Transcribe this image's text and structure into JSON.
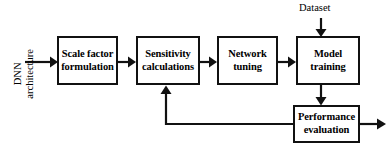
{
  "diagram": {
    "type": "flowchart",
    "colors": {
      "stroke": "#111111",
      "background": "#ffffff",
      "text": "#000000"
    },
    "inputs": [
      {
        "id": "dnn-architecture",
        "label": "DNN\narchitecture",
        "orientation": "vertical"
      },
      {
        "id": "dataset",
        "label": "Dataset",
        "orientation": "horizontal"
      }
    ],
    "nodes": [
      {
        "id": "scale-factor-formulation",
        "label": "Scale factor\nformulation"
      },
      {
        "id": "sensitivity-calculations",
        "label": "Sensitivity\ncalculations"
      },
      {
        "id": "network-tuning",
        "label": "Network\ntuning"
      },
      {
        "id": "model-training",
        "label": "Model\ntraining"
      },
      {
        "id": "performance-evaluation",
        "label": "Performance\nevaluation"
      }
    ],
    "edges": [
      {
        "from": "dnn-architecture",
        "to": "scale-factor-formulation"
      },
      {
        "from": "scale-factor-formulation",
        "to": "sensitivity-calculations"
      },
      {
        "from": "sensitivity-calculations",
        "to": "network-tuning"
      },
      {
        "from": "network-tuning",
        "to": "model-training"
      },
      {
        "from": "dataset",
        "to": "model-training"
      },
      {
        "from": "model-training",
        "to": "performance-evaluation"
      },
      {
        "from": "performance-evaluation",
        "to": "sensitivity-calculations",
        "kind": "feedback"
      },
      {
        "from": "performance-evaluation",
        "to": "output",
        "kind": "output"
      }
    ]
  }
}
